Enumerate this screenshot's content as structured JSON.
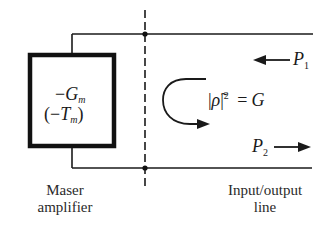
{
  "diagram": {
    "amplifier_box": {
      "conductance": {
        "sign": "−",
        "symbol": "G",
        "subscript": "m"
      },
      "temperature": {
        "open": "(",
        "sign": "−",
        "symbol": "T",
        "subscript": "m",
        "close": ")"
      }
    },
    "reflection_equation": {
      "bar_open": "|",
      "rho": "ρ̃",
      "bar_close": "|",
      "exponent": "2",
      "equals": "=",
      "rhs": "G"
    },
    "incident_power": {
      "symbol": "P",
      "subscript": "1",
      "direction": "left"
    },
    "reflected_power": {
      "symbol": "P",
      "subscript": "2",
      "direction": "right"
    },
    "labels": {
      "amplifier_line1": "Maser",
      "amplifier_line2": "amplifier",
      "line_line1": "Input/output",
      "line_line2": "line"
    },
    "colors": {
      "ink": "#1a1a1a",
      "background": "#ffffff"
    }
  }
}
